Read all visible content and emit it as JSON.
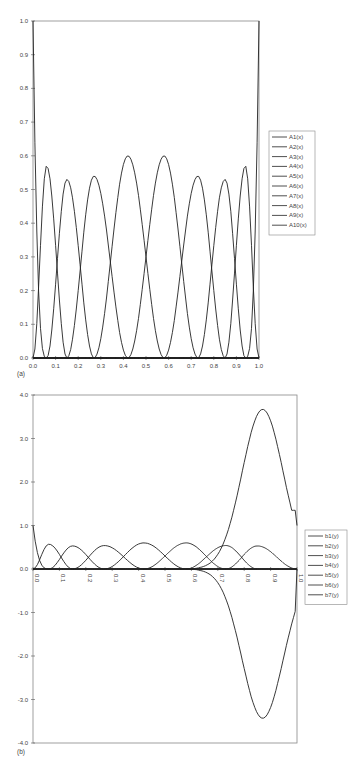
{
  "chart_data": [
    {
      "id": "a",
      "type": "line",
      "panel_label": "(a)",
      "title": "",
      "xlabel": "",
      "ylabel": "",
      "xlim": [
        0.0,
        1.0
      ],
      "ylim": [
        0.0,
        1.0
      ],
      "x_ticks": [
        "0.0",
        "0.1",
        "0.2",
        "0.3",
        "0.4",
        "0.5",
        "0.6",
        "0.7",
        "0.8",
        "0.9",
        "1.0"
      ],
      "y_ticks": [
        "0.0",
        "0.1",
        "0.2",
        "0.3",
        "0.4",
        "0.5",
        "0.6",
        "0.7",
        "0.8",
        "0.9",
        "1.0"
      ],
      "grid": false,
      "legend_position": "right",
      "legend": [
        "A1(x)",
        "A2(x)",
        "A3(x)",
        "A4(x)",
        "A5(x)",
        "A6(x)",
        "A7(x)",
        "A8(x)",
        "A9(x)",
        "A10(x)"
      ],
      "series": [
        {
          "name": "A1(x)",
          "peak_x": 0.0,
          "peak_y": 1.0
        },
        {
          "name": "A2(x)",
          "peak_x": 0.06,
          "peak_y": 0.57
        },
        {
          "name": "A3(x)",
          "peak_x": 0.15,
          "peak_y": 0.53
        },
        {
          "name": "A4(x)",
          "peak_x": 0.27,
          "peak_y": 0.54
        },
        {
          "name": "A5(x)",
          "peak_x": 0.42,
          "peak_y": 0.6
        },
        {
          "name": "A6(x)",
          "peak_x": 0.58,
          "peak_y": 0.6
        },
        {
          "name": "A7(x)",
          "peak_x": 0.73,
          "peak_y": 0.54
        },
        {
          "name": "A8(x)",
          "peak_x": 0.85,
          "peak_y": 0.53
        },
        {
          "name": "A9(x)",
          "peak_x": 0.94,
          "peak_y": 0.57
        },
        {
          "name": "A10(x)",
          "peak_x": 1.0,
          "peak_y": 1.0
        }
      ]
    },
    {
      "id": "b",
      "type": "line",
      "panel_label": "(b)",
      "title": "",
      "xlabel": "",
      "ylabel": "",
      "xlim": [
        0.0,
        1.0
      ],
      "ylim": [
        -4.0,
        4.0
      ],
      "x_ticks": [
        "0.0",
        "0.1",
        "0.2",
        "0.3",
        "0.4",
        "0.5",
        "0.6",
        "0.7",
        "0.8",
        "0.9",
        "1.0"
      ],
      "y_ticks": [
        "-4.0",
        "-3.0",
        "-2.0",
        "-1.0",
        "0.0",
        "1.0",
        "2.0",
        "3.0",
        "4.0"
      ],
      "grid": false,
      "legend_position": "right",
      "legend": [
        "b1(y)",
        "b2(y)",
        "b3(y)",
        "b4(y)",
        "b5(y)",
        "b6(y)",
        "b7(y)"
      ],
      "series": [
        {
          "name": "b1(y)",
          "peak_x": 0.0,
          "peak_y": 1.0
        },
        {
          "name": "b2(y)",
          "peak_x": 0.06,
          "peak_y": 0.57
        },
        {
          "name": "b3(y)",
          "peak_x": 0.15,
          "peak_y": 0.53
        },
        {
          "name": "b4(y)",
          "peak_x": 0.27,
          "peak_y": 0.54
        },
        {
          "name": "b5(y)",
          "peak_x": 0.42,
          "peak_y": 0.6
        },
        {
          "name": "b6(y)",
          "peak_x": 0.87,
          "peak_y": 3.67
        },
        {
          "name": "b7(y)",
          "peak_x": 0.87,
          "peak_y": -3.43
        }
      ]
    }
  ]
}
